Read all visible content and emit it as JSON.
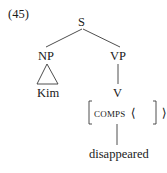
{
  "example_number": "(45)",
  "tree": {
    "root": {
      "label": "S"
    },
    "np": {
      "label": "NP",
      "leaf": "Kim",
      "triangle": true
    },
    "vp": {
      "label": "VP",
      "v": {
        "label": "V",
        "avm": {
          "feature": "COMPS",
          "value_open": "⟨",
          "value_close": "⟩",
          "value": ""
        },
        "leaf": "disappeared"
      }
    }
  },
  "colors": {
    "ink": "#1a1a1a",
    "lines": "#3a3a3a",
    "background": "#ffffff"
  }
}
